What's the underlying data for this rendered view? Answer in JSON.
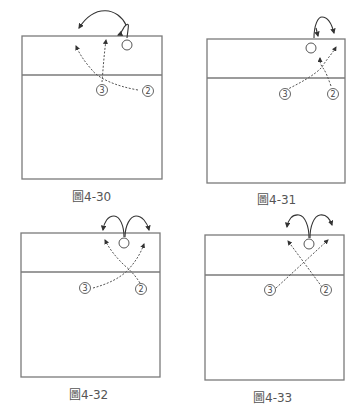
{
  "figures": [
    {
      "id": "4-30",
      "caption": "圖4-30",
      "players": [
        {
          "label": "3"
        },
        {
          "label": "2"
        }
      ],
      "description": "Player 3 and player 2 run crossing dashed routes to the net; ball player makes a looping move to the left"
    },
    {
      "id": "4-31",
      "caption": "圖4-31",
      "players": [
        {
          "label": "3"
        },
        {
          "label": "2"
        }
      ],
      "description": "Player 3 and player 2 cross to the net; ball player loops right"
    },
    {
      "id": "4-32",
      "caption": "圖4-32",
      "players": [
        {
          "label": "3"
        },
        {
          "label": "2"
        }
      ],
      "description": "Player 3 and player 2 cross paths; ball player splits left and right"
    },
    {
      "id": "4-33",
      "caption": "圖4-33",
      "players": [
        {
          "label": "3"
        },
        {
          "label": "2"
        }
      ],
      "description": "Player 3 and player 2 run straight diagonals crossing; ball player splits left and right"
    }
  ],
  "colors": {
    "court_line": "#7a7a7a",
    "route_line": "#555555",
    "caption_text": "#555555"
  }
}
